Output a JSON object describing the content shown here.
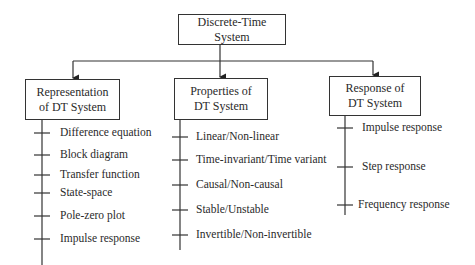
{
  "diagram": {
    "root": {
      "label": "Discrete-Time System"
    },
    "branches": [
      {
        "title_line1": "Representation",
        "title_line2": "of DT System",
        "items": [
          "Difference equation",
          "Block diagram",
          "Transfer function",
          "State-space",
          "Pole-zero plot",
          "Impulse response"
        ]
      },
      {
        "title_line1": "Properties of",
        "title_line2": "DT System",
        "items": [
          "Linear/Non-linear",
          "Time-invariant/Time variant",
          "Causal/Non-causal",
          "Stable/Unstable",
          "Invertible/Non-invertible"
        ]
      },
      {
        "title_line1": "Response of",
        "title_line2": "DT System",
        "items": [
          "Impulse response",
          "Step response",
          "Frequency response"
        ]
      }
    ],
    "colors": {
      "line": "#333333",
      "text": "#2a2a2a",
      "background": "#ffffff"
    }
  }
}
